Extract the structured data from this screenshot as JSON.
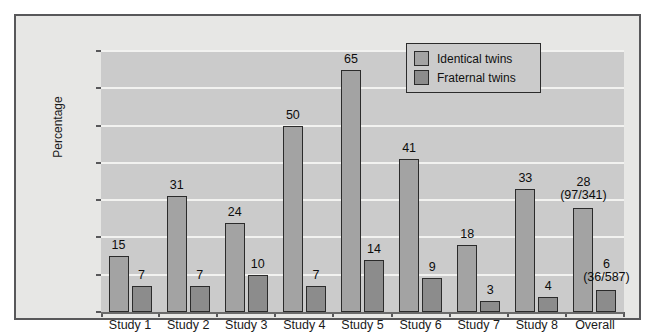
{
  "chart_data": {
    "type": "bar",
    "title": "",
    "xlabel": "",
    "ylabel": "Percentage",
    "ylim": [
      0,
      70
    ],
    "yticks": [
      0,
      10,
      20,
      30,
      40,
      50,
      60,
      70
    ],
    "grid": true,
    "legend_position": "top-right",
    "categories": [
      "Study 1",
      "Study 2",
      "Study 3",
      "Study 4",
      "Study 5",
      "Study 6",
      "Study 7",
      "Study 8",
      "Overall"
    ],
    "series": [
      {
        "name": "Identical twins",
        "color": "#a3a3a3",
        "values": [
          15,
          31,
          24,
          50,
          65,
          41,
          18,
          33,
          28
        ],
        "labels": [
          "15",
          "31",
          "24",
          "50",
          "65",
          "41",
          "18",
          "33",
          "28"
        ],
        "sublabels": [
          "",
          "",
          "",
          "",
          "",
          "",
          "",
          "",
          "(97/341)"
        ]
      },
      {
        "name": "Fraternal twins",
        "color": "#8c8c8c",
        "values": [
          7,
          7,
          10,
          7,
          14,
          9,
          3,
          4,
          6
        ],
        "labels": [
          "7",
          "7",
          "10",
          "7",
          "14",
          "9",
          "3",
          "4",
          "6"
        ],
        "sublabels": [
          "",
          "",
          "",
          "",
          "",
          "",
          "",
          "",
          "(36/587)"
        ]
      }
    ]
  },
  "axis": {
    "y_title": "Percentage",
    "y_tick_labels": [
      "70",
      "60",
      "50",
      "40",
      "30",
      "20",
      "10",
      "0"
    ],
    "x_tick_labels": [
      "Study 1",
      "Study 2",
      "Study 3",
      "Study 4",
      "Study 5",
      "Study 6",
      "Study 7",
      "Study 8",
      "Overall"
    ]
  },
  "legend": {
    "items": [
      {
        "label": "Identical twins",
        "swatch": "identical"
      },
      {
        "label": "Fraternal twins",
        "swatch": "fraternal"
      }
    ]
  }
}
